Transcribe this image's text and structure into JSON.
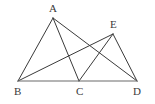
{
  "figure": {
    "background_color": "#ffffff",
    "line_color": "#3a3a3a",
    "baseline_color": "#6b6b6b",
    "label_color": "#3a3a3a",
    "points": [
      {
        "id": "A",
        "label": "A",
        "x": 53,
        "y": 18,
        "label_x": 49,
        "label_y": 3
      },
      {
        "id": "E",
        "label": "E",
        "x": 113,
        "y": 34,
        "label_x": 110,
        "label_y": 19
      },
      {
        "id": "B",
        "label": "B",
        "x": 18,
        "y": 81,
        "label_x": 14,
        "label_y": 86
      },
      {
        "id": "C",
        "label": "C",
        "x": 79,
        "y": 81,
        "label_x": 76,
        "label_y": 86
      },
      {
        "id": "D",
        "label": "D",
        "x": 137,
        "y": 81,
        "label_x": 133,
        "label_y": 86
      }
    ],
    "segments": [
      {
        "name": "segment-BA",
        "from": "B",
        "to": "A",
        "x1": 18,
        "y1": 81,
        "x2": 53,
        "y2": 18
      },
      {
        "name": "segment-AC",
        "from": "A",
        "to": "C",
        "x1": 53,
        "y1": 18,
        "x2": 79,
        "y2": 81
      },
      {
        "name": "segment-AD",
        "from": "A",
        "to": "D",
        "x1": 53,
        "y1": 18,
        "x2": 137,
        "y2": 81
      },
      {
        "name": "segment-BE",
        "from": "B",
        "to": "E",
        "x1": 18,
        "y1": 81,
        "x2": 113,
        "y2": 34
      },
      {
        "name": "segment-EC",
        "from": "E",
        "to": "C",
        "x1": 113,
        "y1": 34,
        "x2": 79,
        "y2": 81
      },
      {
        "name": "segment-ED",
        "from": "E",
        "to": "D",
        "x1": 113,
        "y1": 34,
        "x2": 137,
        "y2": 81
      },
      {
        "name": "segment-BD",
        "from": "B",
        "to": "D",
        "x1": 18,
        "y1": 81,
        "x2": 137,
        "y2": 81
      }
    ]
  }
}
